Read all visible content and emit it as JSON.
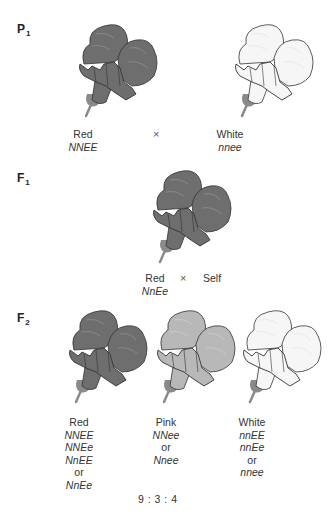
{
  "colors": {
    "red_fill": "#6e6e6e",
    "red_dark": "#555555",
    "pink_fill": "#b8b8b8",
    "pink_dark": "#9a9a9a",
    "white_fill": "#f6f6f6",
    "white_dark": "#e4e4e4",
    "outline": "#333333",
    "calyx": "#8a8a8a"
  },
  "P1": {
    "label": "P",
    "sub": "1",
    "parents": [
      {
        "phenotype": "Red",
        "genotype": "NNEE",
        "color": "red"
      },
      {
        "phenotype": "White",
        "genotype": "nnee",
        "color": "white"
      }
    ],
    "cross_symbol": "×"
  },
  "F1": {
    "label": "F",
    "sub": "1",
    "phenotype": "Red",
    "genotype": "NnEe",
    "cross_symbol": "×",
    "partner": "Self",
    "color": "red"
  },
  "F2": {
    "label": "F",
    "sub": "2",
    "classes": [
      {
        "phenotype": "Red",
        "genotypes": [
          "NNEE",
          "NNEe",
          "NnEE"
        ],
        "or": "or",
        "last": "NnEe",
        "color": "red"
      },
      {
        "phenotype": "Pink",
        "genotypes": [
          "NNee"
        ],
        "or": "or",
        "last": "Nnee",
        "color": "pink"
      },
      {
        "phenotype": "White",
        "genotypes": [
          "nnEE",
          "nnEe"
        ],
        "or": "or",
        "last": "nnee",
        "color": "white"
      }
    ],
    "ratio": "9 : 3 : 4"
  }
}
